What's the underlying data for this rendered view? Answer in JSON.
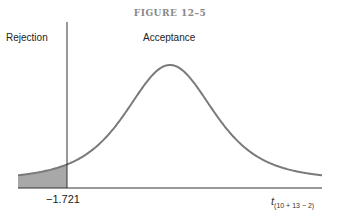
{
  "figure": {
    "title": "FIGURE 12–5",
    "region_left_label": "Rejection",
    "region_right_label": "Acceptance",
    "critical_value_label": "−1.721",
    "axis_label_main": "t",
    "axis_label_sub": "(10 + 13 − 2)",
    "distribution": "t",
    "degrees_of_freedom": 21,
    "critical_value": -1.721,
    "rejection_tail": "left",
    "colors": {
      "curve": "#7a7a7a",
      "shaded_region": "#a8a8a8",
      "lines": "#333333"
    }
  }
}
